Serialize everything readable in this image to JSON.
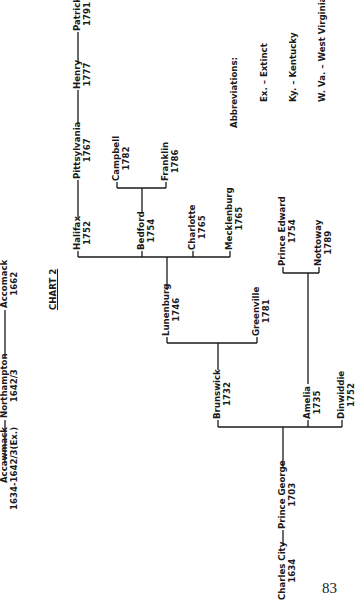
{
  "chart": {
    "title": "CHART 2",
    "nodes": {
      "accawmack": {
        "name": "Accawmack",
        "year": "1634-1642/3(Ex.)"
      },
      "northampton": {
        "name": "Northampton",
        "year": "1642/3"
      },
      "accomack": {
        "name": "Accomack",
        "year": "1662"
      },
      "charles_city": {
        "name": "Charles City",
        "year": "1634"
      },
      "prince_george": {
        "name": "Prince George",
        "year": "1703"
      },
      "brunswick": {
        "name": "Brunswick",
        "year": "1732"
      },
      "amelia": {
        "name": "Amelia",
        "year": "1735"
      },
      "dinwiddie": {
        "name": "Dinwiddie",
        "year": "1752"
      },
      "lunenburg": {
        "name": "Lunenburg",
        "year": "1746"
      },
      "greenville": {
        "name": "Greenville",
        "year": "1781"
      },
      "halifax": {
        "name": "Halifax",
        "year": "1752"
      },
      "bedford": {
        "name": "Bedford",
        "year": "1754"
      },
      "charlotte": {
        "name": "Charlotte",
        "year": "1765"
      },
      "mecklenburg": {
        "name": "Mecklenburg",
        "year": "1765"
      },
      "campbell": {
        "name": "Campbell",
        "year": "1782"
      },
      "franklin": {
        "name": "Franklin",
        "year": "1786"
      },
      "pittsylvania": {
        "name": "Pittsylvania",
        "year": "1767"
      },
      "henry": {
        "name": "Henry",
        "year": "1777"
      },
      "patrick": {
        "name": "Patrick",
        "year": "1791"
      },
      "prince_edward": {
        "name": "Prince Edward",
        "year": "1754"
      },
      "nottoway": {
        "name": "Nottoway",
        "year": "1789"
      }
    }
  },
  "abbreviations": {
    "title": "Abbreviations:",
    "items": [
      "Ex. – Extinct",
      "Ky. – Kentucky",
      "W. Va. – West Virginia"
    ]
  },
  "page_number": "83"
}
